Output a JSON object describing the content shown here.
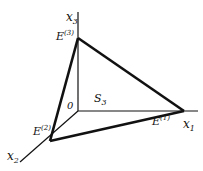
{
  "diagram": {
    "axes": {
      "x1": {
        "name": "x",
        "sub": "1"
      },
      "x2": {
        "name": "x",
        "sub": "2"
      },
      "x3": {
        "name": "x",
        "sub": "3"
      }
    },
    "origin": {
      "label": "0"
    },
    "vertices": {
      "e1": {
        "name": "E",
        "sup": "(1)"
      },
      "e2": {
        "name": "E",
        "sup": "(2)"
      },
      "e3": {
        "name": "E",
        "sup": "(3)"
      }
    },
    "simplex": {
      "name": "S",
      "sub": "3"
    },
    "colors": {
      "stroke": "#111111",
      "background": "#ffffff"
    }
  }
}
